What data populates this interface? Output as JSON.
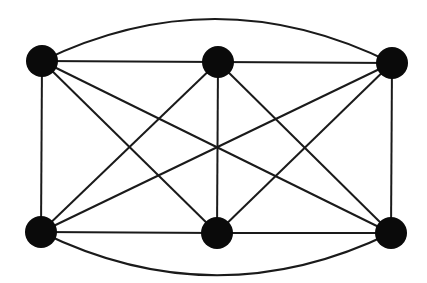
{
  "diagram": {
    "type": "complete-graph-K6",
    "width": 427,
    "height": 283,
    "colors": {
      "background": "#ffffff",
      "edge": "#1a1a1a",
      "node": "#0a0a0a"
    },
    "node_radius": 16,
    "nodes": [
      {
        "id": "A",
        "x": 42,
        "y": 61
      },
      {
        "id": "B",
        "x": 218,
        "y": 62
      },
      {
        "id": "C",
        "x": 392,
        "y": 63
      },
      {
        "id": "D",
        "x": 41,
        "y": 232
      },
      {
        "id": "E",
        "x": 217,
        "y": 233
      },
      {
        "id": "F",
        "x": 391,
        "y": 233
      }
    ],
    "edges": [
      {
        "from": "A",
        "to": "B"
      },
      {
        "from": "B",
        "to": "C"
      },
      {
        "from": "A",
        "to": "C",
        "curve": "arc-top",
        "control_y": -24
      },
      {
        "from": "D",
        "to": "E"
      },
      {
        "from": "E",
        "to": "F"
      },
      {
        "from": "D",
        "to": "F",
        "curve": "arc-bottom",
        "control_y": 318
      },
      {
        "from": "A",
        "to": "D"
      },
      {
        "from": "B",
        "to": "E"
      },
      {
        "from": "C",
        "to": "F"
      },
      {
        "from": "A",
        "to": "E"
      },
      {
        "from": "A",
        "to": "F"
      },
      {
        "from": "B",
        "to": "D"
      },
      {
        "from": "B",
        "to": "F"
      },
      {
        "from": "C",
        "to": "D"
      },
      {
        "from": "C",
        "to": "E"
      }
    ]
  }
}
